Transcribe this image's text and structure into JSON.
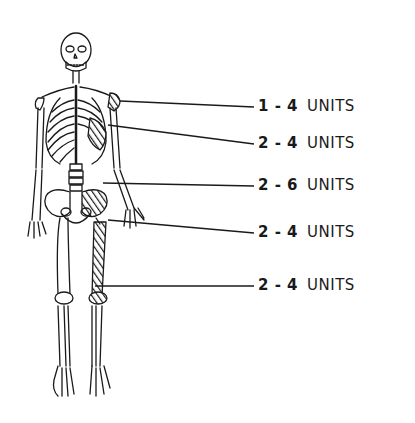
{
  "figure": {
    "title": "",
    "line_color": "#1a1a1a",
    "background": "#ffffff"
  },
  "annotations": [
    {
      "range": "1 - 4",
      "unit": "UNITS",
      "target": "shoulder-left",
      "y": 107
    },
    {
      "range": "2 - 4",
      "unit": "UNITS",
      "target": "ribs-left",
      "y": 144
    },
    {
      "range": "2 - 6",
      "unit": "UNITS",
      "target": "pelvis-left",
      "y": 186
    },
    {
      "range": "2 - 4",
      "unit": "UNITS",
      "target": "femur-left",
      "y": 233
    },
    {
      "range": "2 - 4",
      "unit": "UNITS",
      "target": "knee-tibia-left",
      "y": 286
    }
  ]
}
